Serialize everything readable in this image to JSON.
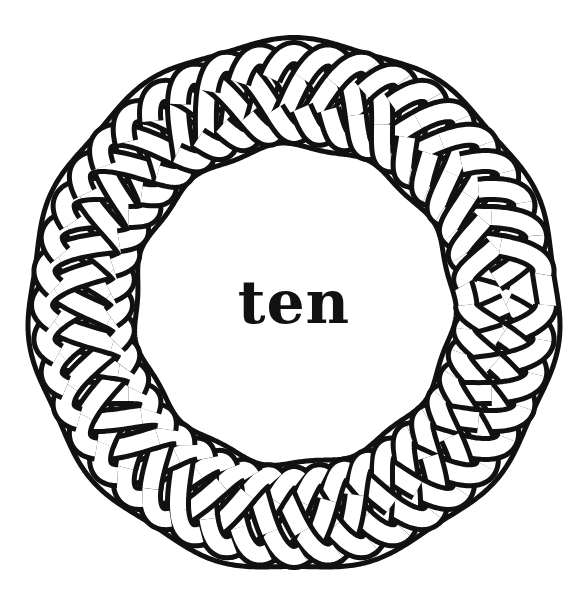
{
  "artwork": {
    "type": "celtic-knot-ring",
    "center_word": "ten",
    "colors": {
      "background": "#ffffff",
      "outline": "#111111",
      "ribbon_fill": "#ffffff",
      "text": "#111111"
    },
    "ring": {
      "cx": 294,
      "cy": 305,
      "outer_radius": 262,
      "inner_radius": 162,
      "strand_count": 4,
      "lobes": 11,
      "ribbon_width": 16,
      "outline_width": 5
    }
  }
}
